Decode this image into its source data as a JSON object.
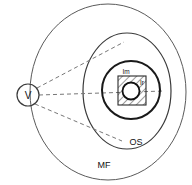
{
  "diagram": {
    "background_color": "#ffffff",
    "labels": {
      "source": "V",
      "outer_region": "MF",
      "middle_region": "OS",
      "hatched_region": "Im",
      "core_region": "Ir"
    },
    "colors": {
      "outline_thin": "#5a5a5a",
      "outline_mid": "#3a3a3a",
      "outline_bold": "#1a1a1a",
      "dashed_ray": "#777777",
      "text": "#111111",
      "core_fill": "#ffffff"
    },
    "shapes": [
      {
        "name": "outer-ellipse",
        "label": "MF",
        "type": "ellipse",
        "cx": 108,
        "cy": 92,
        "rx": 78,
        "ry": 88
      },
      {
        "name": "middle-ellipse",
        "label": "OS",
        "type": "ellipse",
        "cx": 127,
        "cy": 91,
        "rx": 44,
        "ry": 58
      },
      {
        "name": "inner-circle",
        "label": "",
        "type": "circle",
        "cx": 131,
        "cy": 90,
        "r": 29
      },
      {
        "name": "hatched-square",
        "label": "Im",
        "type": "rect",
        "x": 118,
        "y": 76,
        "width": 28,
        "height": 29
      },
      {
        "name": "core-circle",
        "label": "Ir",
        "type": "circle",
        "cx": 131,
        "cy": 91,
        "r": 8.5
      },
      {
        "name": "source-circle",
        "label": "V",
        "type": "circle",
        "cx": 28,
        "cy": 95,
        "r": 11
      }
    ],
    "rays": [
      {
        "name": "upper-dashed-ray",
        "x1": 37,
        "y1": 88,
        "x2": 124,
        "y2": 42
      },
      {
        "name": "center-dashed-ray",
        "x1": 39,
        "y1": 95,
        "x2": 162,
        "y2": 91
      },
      {
        "name": "lower-dashed-ray",
        "x1": 35,
        "y1": 104,
        "x2": 122,
        "y2": 141
      }
    ]
  }
}
